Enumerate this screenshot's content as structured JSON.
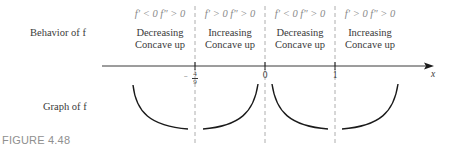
{
  "row_labels": {
    "behavior": "Behavior of f",
    "graph": "Graph of f"
  },
  "intervals": [
    {
      "condition": "f′ < 0  f″ > 0",
      "line1": "Decreasing",
      "line2": "Concave up"
    },
    {
      "condition": "f′ > 0  f″ > 0",
      "line1": "Increasing",
      "line2": "Concave up"
    },
    {
      "condition": "f′ < 0  f″ > 0",
      "line1": "Decreasing",
      "line2": "Concave up"
    },
    {
      "condition": "f′ > 0  f″ > 0",
      "line1": "Increasing",
      "line2": "Concave up"
    }
  ],
  "axis": {
    "variable": "x",
    "ticks": [
      {
        "label_num": "4",
        "label_den": "9",
        "sign": "−",
        "value": "-4/9"
      },
      {
        "label": "0",
        "value": "0"
      },
      {
        "label": "1",
        "value": "1"
      }
    ]
  },
  "caption": "FIGURE 4.48",
  "colors": {
    "curve": "#1a1a1a",
    "axis": "#3a3a3a",
    "dashed": "#9a9a9a",
    "caption": "#8f8f8f"
  }
}
